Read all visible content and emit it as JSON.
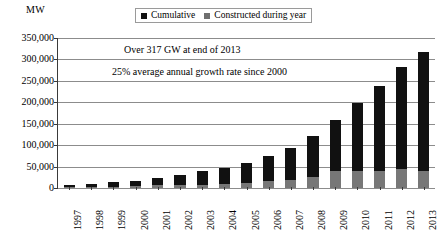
{
  "axis_unit_label": "MW",
  "legend": {
    "position": "top-center",
    "items": [
      {
        "label": "Cumulative",
        "color": "#111111"
      },
      {
        "label": "Constructed during year",
        "color": "#6f6f6f"
      }
    ]
  },
  "annotations": [
    "Over 317 GW at end of 2013",
    "25% average annual growth rate since 2000"
  ],
  "chart_data": {
    "type": "bar",
    "title": "",
    "subtitle": "",
    "xlabel": "",
    "ylabel": "MW",
    "ylim": [
      0,
      350000
    ],
    "ytick_step": 50000,
    "ytick_labels": [
      "0",
      "50,000",
      "100,000",
      "150,000",
      "200,000",
      "250,000",
      "300,000",
      "350,000"
    ],
    "ytick_values": [
      0,
      50000,
      100000,
      150000,
      200000,
      250000,
      300000,
      350000
    ],
    "grid": true,
    "stacked_overlay": true,
    "categories": [
      "1997",
      "1998",
      "1999",
      "2000",
      "2001",
      "2002",
      "2003",
      "2004",
      "2005",
      "2006",
      "2007",
      "2008",
      "2009",
      "2010",
      "2011",
      "2012",
      "2013"
    ],
    "series": [
      {
        "name": "Cumulative",
        "color": "#111111",
        "values": [
          7600,
          10200,
          13600,
          17400,
          23900,
          31100,
          39431,
          47620,
          59091,
          74052,
          93820,
          120550,
          158908,
          197637,
          238035,
          282482,
          318105
        ]
      },
      {
        "name": "Constructed during year",
        "color": "#777777",
        "values": [
          1530,
          2520,
          3440,
          3760,
          6500,
          7270,
          8133,
          8207,
          11531,
          15244,
          19866,
          26560,
          38610,
          38828,
          40636,
          44799,
          39062
        ]
      }
    ],
    "annotations": [
      "Over 317 GW at end of 2013",
      "25% average annual growth rate since 2000"
    ]
  }
}
